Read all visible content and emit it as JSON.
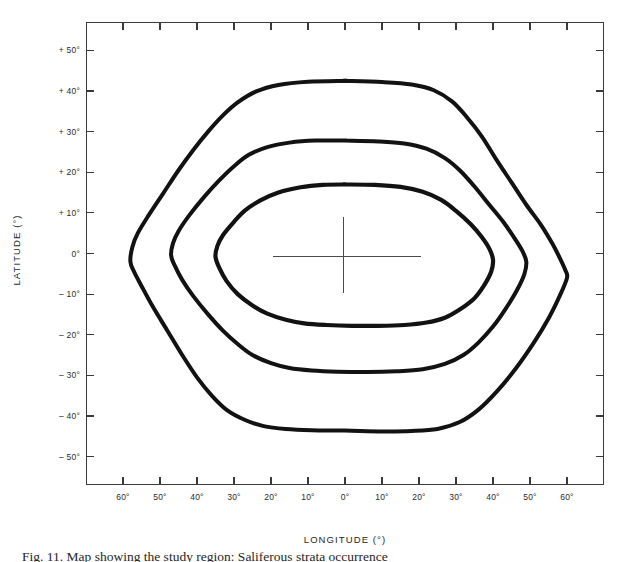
{
  "figure": {
    "caption": "Fig. 11.  Map showing the study region: Saliferous strata occurrence"
  },
  "axes": {
    "x_title": "LONGITUDE (°)",
    "y_title": "LATITUDE (°)",
    "x_tick_labels": [
      "60°",
      "50°",
      "40°",
      "30°",
      "20°",
      "10°",
      "0°",
      "10°",
      "20°",
      "30°",
      "40°",
      "50°",
      "60°"
    ],
    "y_tick_labels": [
      "+ 50°",
      "+ 40°",
      "+ 30°",
      "+ 20°",
      "+ 10°",
      "0°",
      "– 10°",
      "– 20°",
      "– 30°",
      "– 40°",
      "– 50°"
    ]
  },
  "chart_data": {
    "type": "line",
    "title": "",
    "xlabel": "LONGITUDE (°)",
    "ylabel": "LATITUDE (°)",
    "xlim": [
      -70,
      70
    ],
    "ylim": [
      -57,
      57
    ],
    "x_ticks": [
      -60,
      -50,
      -40,
      -30,
      -20,
      -10,
      0,
      10,
      20,
      30,
      40,
      50,
      60
    ],
    "x_tick_labels": [
      "60°",
      "50°",
      "40°",
      "30°",
      "20°",
      "10°",
      "0°",
      "10°",
      "20°",
      "30°",
      "40°",
      "50°",
      "60°"
    ],
    "y_ticks": [
      50,
      40,
      30,
      20,
      10,
      0,
      -10,
      -20,
      -30,
      -40,
      -50
    ],
    "y_tick_labels": [
      "+ 50°",
      "+ 40°",
      "+ 30°",
      "+ 20°",
      "+ 10°",
      "0°",
      "– 10°",
      "– 20°",
      "– 30°",
      "– 40°",
      "– 50°"
    ],
    "grid": false,
    "legend": "none",
    "annotations": [
      {
        "name": "origin-crosshair",
        "x": 0,
        "y": 0,
        "x_extent": [
          -9,
          11
        ],
        "y_extent": [
          -9,
          9
        ]
      }
    ],
    "series": [
      {
        "name": "outer-contour",
        "closed": true,
        "stroke_width": 4.0,
        "points": [
          [
            0,
            42.5
          ],
          [
            10,
            42.2
          ],
          [
            18,
            41.6
          ],
          [
            24,
            40.2
          ],
          [
            29,
            37.4
          ],
          [
            33,
            33.5
          ],
          [
            37,
            28.8
          ],
          [
            41,
            23.0
          ],
          [
            45,
            17.5
          ],
          [
            49,
            12.0
          ],
          [
            53,
            7.0
          ],
          [
            56,
            2.5
          ],
          [
            58,
            -1.0
          ],
          [
            59.5,
            -4.0
          ],
          [
            60,
            -6.0
          ],
          [
            58,
            -10.5
          ],
          [
            55,
            -16.0
          ],
          [
            51,
            -22.0
          ],
          [
            46,
            -28.5
          ],
          [
            41,
            -34.0
          ],
          [
            36,
            -38.5
          ],
          [
            31,
            -41.5
          ],
          [
            25,
            -43.2
          ],
          [
            18,
            -43.7
          ],
          [
            10,
            -43.8
          ],
          [
            0,
            -43.6
          ],
          [
            -9,
            -43.5
          ],
          [
            -16,
            -43.2
          ],
          [
            -22,
            -42.5
          ],
          [
            -27,
            -41.0
          ],
          [
            -32,
            -38.5
          ],
          [
            -36,
            -35.0
          ],
          [
            -40,
            -30.5
          ],
          [
            -44,
            -25.0
          ],
          [
            -48,
            -19.0
          ],
          [
            -52,
            -13.0
          ],
          [
            -55,
            -8.0
          ],
          [
            -57,
            -4.5
          ],
          [
            -58,
            -2.0
          ],
          [
            -57.5,
            1.5
          ],
          [
            -56,
            5.0
          ],
          [
            -53,
            9.5
          ],
          [
            -49,
            15.0
          ],
          [
            -45,
            20.5
          ],
          [
            -41,
            25.5
          ],
          [
            -37,
            30.0
          ],
          [
            -33,
            34.0
          ],
          [
            -29,
            37.2
          ],
          [
            -24,
            39.9
          ],
          [
            -18,
            41.5
          ],
          [
            -10,
            42.3
          ],
          [
            0,
            42.5
          ]
        ]
      },
      {
        "name": "middle-contour",
        "closed": true,
        "stroke_width": 4.0,
        "points": [
          [
            0,
            27.8
          ],
          [
            9,
            27.6
          ],
          [
            16,
            27.1
          ],
          [
            22,
            25.8
          ],
          [
            27,
            23.5
          ],
          [
            31,
            20.5
          ],
          [
            35,
            16.5
          ],
          [
            39,
            12.0
          ],
          [
            43,
            7.5
          ],
          [
            46,
            3.5
          ],
          [
            48,
            0.5
          ],
          [
            49,
            -2.0
          ],
          [
            48.5,
            -5.0
          ],
          [
            46.5,
            -9.0
          ],
          [
            43.5,
            -13.5
          ],
          [
            40,
            -18.0
          ],
          [
            36,
            -22.0
          ],
          [
            32,
            -25.0
          ],
          [
            27,
            -27.2
          ],
          [
            21,
            -28.5
          ],
          [
            14,
            -29.0
          ],
          [
            6,
            -29.2
          ],
          [
            -2,
            -29.1
          ],
          [
            -9,
            -28.8
          ],
          [
            -15,
            -28.2
          ],
          [
            -20,
            -27.0
          ],
          [
            -25,
            -25.0
          ],
          [
            -29,
            -22.3
          ],
          [
            -33,
            -19.0
          ],
          [
            -37,
            -15.0
          ],
          [
            -41,
            -10.5
          ],
          [
            -44,
            -6.5
          ],
          [
            -46,
            -3.0
          ],
          [
            -47,
            -0.5
          ],
          [
            -46.5,
            2.5
          ],
          [
            -45,
            5.5
          ],
          [
            -42,
            9.5
          ],
          [
            -38,
            14.0
          ],
          [
            -34,
            18.0
          ],
          [
            -30,
            21.5
          ],
          [
            -26,
            24.3
          ],
          [
            -21,
            26.2
          ],
          [
            -15,
            27.3
          ],
          [
            -8,
            27.8
          ],
          [
            0,
            27.8
          ]
        ]
      },
      {
        "name": "inner-contour",
        "closed": true,
        "stroke_width": 4.2,
        "points": [
          [
            0,
            17.0
          ],
          [
            8,
            16.9
          ],
          [
            15,
            16.4
          ],
          [
            21,
            15.2
          ],
          [
            26,
            13.2
          ],
          [
            30,
            10.5
          ],
          [
            34,
            7.2
          ],
          [
            37,
            4.0
          ],
          [
            39,
            1.2
          ],
          [
            40,
            -1.5
          ],
          [
            39.5,
            -4.5
          ],
          [
            37.5,
            -8.0
          ],
          [
            35,
            -11.0
          ],
          [
            31,
            -13.8
          ],
          [
            27,
            -15.8
          ],
          [
            22,
            -17.0
          ],
          [
            16,
            -17.6
          ],
          [
            9,
            -17.8
          ],
          [
            2,
            -17.8
          ],
          [
            -5,
            -17.6
          ],
          [
            -11,
            -17.2
          ],
          [
            -16,
            -16.3
          ],
          [
            -21,
            -14.8
          ],
          [
            -25,
            -12.8
          ],
          [
            -29,
            -10.0
          ],
          [
            -32,
            -6.8
          ],
          [
            -34,
            -3.5
          ],
          [
            -35,
            -0.8
          ],
          [
            -34.5,
            1.8
          ],
          [
            -33,
            4.5
          ],
          [
            -30,
            7.8
          ],
          [
            -27,
            10.6
          ],
          [
            -23,
            13.0
          ],
          [
            -18,
            15.0
          ],
          [
            -12,
            16.3
          ],
          [
            -6,
            16.9
          ],
          [
            0,
            17.0
          ]
        ]
      }
    ]
  }
}
